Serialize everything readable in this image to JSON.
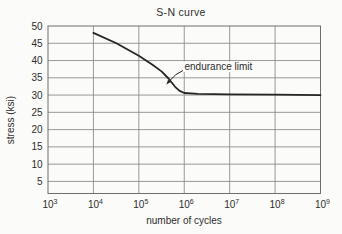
{
  "chart_data": {
    "type": "line",
    "title": "S-N curve",
    "xlabel": "number of cycles",
    "ylabel": "stress (ksi)",
    "x_scale": "log10",
    "xlim_log10": [
      3,
      9
    ],
    "x_tick_base": "10",
    "x_ticks_exponents": [
      3,
      4,
      5,
      6,
      7,
      8,
      9
    ],
    "y_ticks": [
      50,
      45,
      40,
      35,
      30,
      25,
      20,
      15,
      10,
      5
    ],
    "ylim": [
      1.5,
      50
    ],
    "grid": true,
    "legend": "none",
    "annotation": {
      "text": "endurance limit",
      "arrow_points_to": {
        "cycles": 400000,
        "stress": 35
      }
    },
    "endurance_limit_ksi": 30,
    "series": [
      {
        "name": "S-N fatigue curve",
        "points": [
          [
            10000,
            48
          ],
          [
            32000,
            45
          ],
          [
            100000,
            41.4
          ],
          [
            200000,
            38.8
          ],
          [
            320000,
            36.8
          ],
          [
            450000,
            34.8
          ],
          [
            630000,
            32.4
          ],
          [
            790000,
            31.2
          ],
          [
            1000000,
            30.6
          ],
          [
            2000000,
            30.35
          ],
          [
            10000000,
            30.2
          ],
          [
            100000000,
            30.1
          ],
          [
            1000000000,
            30.0
          ]
        ]
      }
    ],
    "colors": {
      "curve": "#262626",
      "grid": "#8d8d8d",
      "frame": "#6e6e6e",
      "text": "#2e2e2e",
      "background": "#fbfbf9"
    }
  }
}
